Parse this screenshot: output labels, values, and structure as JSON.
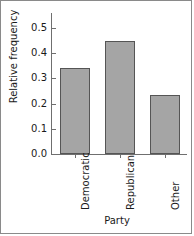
{
  "chart_data": {
    "type": "bar",
    "title": "",
    "categories": [
      "Democratic",
      "Republican",
      "Other"
    ],
    "values": [
      0.34,
      0.45,
      0.235
    ],
    "xlabel": "Party",
    "ylabel": "Relative frequency",
    "ylim": [
      0.0,
      0.5
    ],
    "yticks": [
      "0.0",
      "0.1",
      "0.2",
      "0.3",
      "0.4",
      "0.5"
    ],
    "ytick_values": [
      0.0,
      0.1,
      0.2,
      0.3,
      0.4,
      0.5
    ],
    "grid": false,
    "legend": "none",
    "bar_fill_color": "#a5a5a5",
    "bar_edge_color": "#555555",
    "axis_color": "#6f6f6f",
    "text_color": "#1a1a1a",
    "background_color": "#ffffff"
  }
}
